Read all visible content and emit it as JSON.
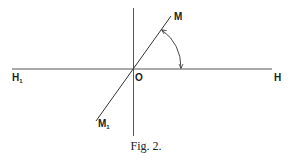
{
  "figure": {
    "caption": "Fig. 2.",
    "labels": {
      "origin": "O",
      "m": "M",
      "m1_base": "M",
      "m1_sub": "1",
      "h": "H",
      "h1_base": "H",
      "h1_sub": "1"
    },
    "lines": [
      {
        "name": "horizontal-axis",
        "from": "H1",
        "to": "H"
      },
      {
        "name": "vertical-axis"
      },
      {
        "name": "oblique-line",
        "from": "M1",
        "to": "M"
      }
    ],
    "angle_arc": {
      "between": [
        "OM",
        "OH"
      ],
      "arrows": "both-ends"
    },
    "stroke_color": "#333333"
  }
}
